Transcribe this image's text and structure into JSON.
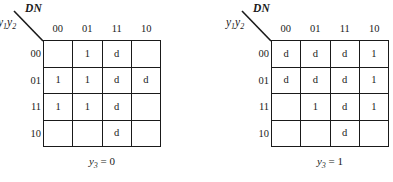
{
  "figure": {
    "type": "karnaugh-map-pair",
    "background_color": "#ffffff",
    "line_color": "#1a1a1a"
  },
  "maps": [
    {
      "id": "left",
      "corner_col_label": "DN",
      "corner_row_label_base": "y",
      "corner_row_label": "y1y2",
      "col_headers": [
        "00",
        "01",
        "11",
        "10"
      ],
      "row_headers": [
        "00",
        "01",
        "11",
        "10"
      ],
      "caption_var": "y",
      "caption_sub": "3",
      "caption_eq": "=",
      "caption_value": "0",
      "caption": "y3 = 0",
      "cells": [
        [
          "",
          "1",
          "d",
          ""
        ],
        [
          "1",
          "1",
          "d",
          "d"
        ],
        [
          "1",
          "1",
          "d",
          ""
        ],
        [
          "",
          "",
          "d",
          ""
        ]
      ]
    },
    {
      "id": "right",
      "corner_col_label": "DN",
      "corner_row_label_base": "y",
      "corner_row_label": "y1y2",
      "col_headers": [
        "00",
        "01",
        "11",
        "10"
      ],
      "row_headers": [
        "00",
        "01",
        "11",
        "10"
      ],
      "caption_var": "y",
      "caption_sub": "3",
      "caption_eq": "=",
      "caption_value": "1",
      "caption": "y3 = 1",
      "cells": [
        [
          "d",
          "d",
          "d",
          "1"
        ],
        [
          "d",
          "d",
          "d",
          "1"
        ],
        [
          "",
          "1",
          "d",
          "1"
        ],
        [
          "",
          "",
          "d",
          ""
        ]
      ]
    }
  ]
}
